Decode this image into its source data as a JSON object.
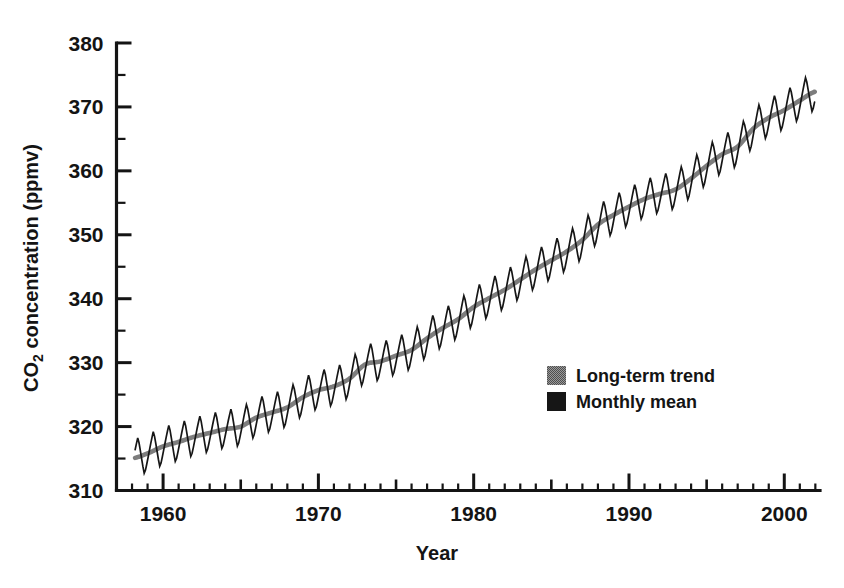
{
  "chart_data": {
    "type": "line",
    "title": "",
    "xlabel": "Year",
    "ylabel": "CO2 concentration (ppmv)",
    "ylabel_main": "concentration (ppmv)",
    "ylabel_prefix": "CO",
    "ylabel_subscript": "2",
    "xlim": [
      1957.0,
      2002.3
    ],
    "ylim": [
      310,
      380
    ],
    "xticks": [
      1960,
      1970,
      1980,
      1990,
      2000
    ],
    "xtick_labels": [
      "1960",
      "1970",
      "1980",
      "1990",
      "2000"
    ],
    "xtick_minor_step": 1,
    "xtick_mid_step": 5,
    "yticks": [
      310,
      320,
      330,
      340,
      350,
      360,
      370,
      380
    ],
    "ytick_labels": [
      "310",
      "320",
      "330",
      "340",
      "350",
      "360",
      "370",
      "380"
    ],
    "ytick_minor": [
      315,
      325,
      335,
      345,
      355,
      365,
      375
    ],
    "grid": false,
    "legend_position": "center-right",
    "seasonal_amplitude_ppmv": 3.1,
    "data_start_year": 1958.2,
    "data_end_year": 2002.0,
    "series": [
      {
        "name": "Long-term trend",
        "color": "#7d7d7d",
        "type": "line",
        "x": [
          1958,
          1959,
          1960,
          1961,
          1962,
          1963,
          1964,
          1965,
          1966,
          1967,
          1968,
          1969,
          1970,
          1971,
          1972,
          1973,
          1974,
          1975,
          1976,
          1977,
          1978,
          1979,
          1980,
          1981,
          1982,
          1983,
          1984,
          1985,
          1986,
          1987,
          1988,
          1989,
          1990,
          1991,
          1992,
          1993,
          1994,
          1995,
          1996,
          1997,
          1998,
          1999,
          2000,
          2001,
          2002
        ],
        "values": [
          315.0,
          315.8,
          316.9,
          317.6,
          318.4,
          319.0,
          319.6,
          320.0,
          321.4,
          322.2,
          323.0,
          324.6,
          325.7,
          326.3,
          327.5,
          329.7,
          330.2,
          331.1,
          332.0,
          333.8,
          335.4,
          336.8,
          338.7,
          340.1,
          341.4,
          343.0,
          344.6,
          346.0,
          347.4,
          349.2,
          351.6,
          353.1,
          354.4,
          355.6,
          356.4,
          357.1,
          358.8,
          360.8,
          362.6,
          363.8,
          366.6,
          368.3,
          369.5,
          371.0,
          372.4
        ]
      },
      {
        "name": "Monthly mean",
        "color": "#161616",
        "type": "line",
        "description": "Monthly mean CO2 with seasonal sawtooth oscillation of approximately plus or minus 3 ppmv superimposed on the long-term trend"
      }
    ]
  },
  "legend": {
    "items": [
      {
        "label": "Long-term trend",
        "swatch": "#7d7d7d",
        "style": "dithered-gray"
      },
      {
        "label": "Monthly mean",
        "swatch": "#161616",
        "style": "solid-black"
      }
    ]
  },
  "figure": {
    "background": "#ffffff",
    "axis_color": "#141414"
  }
}
